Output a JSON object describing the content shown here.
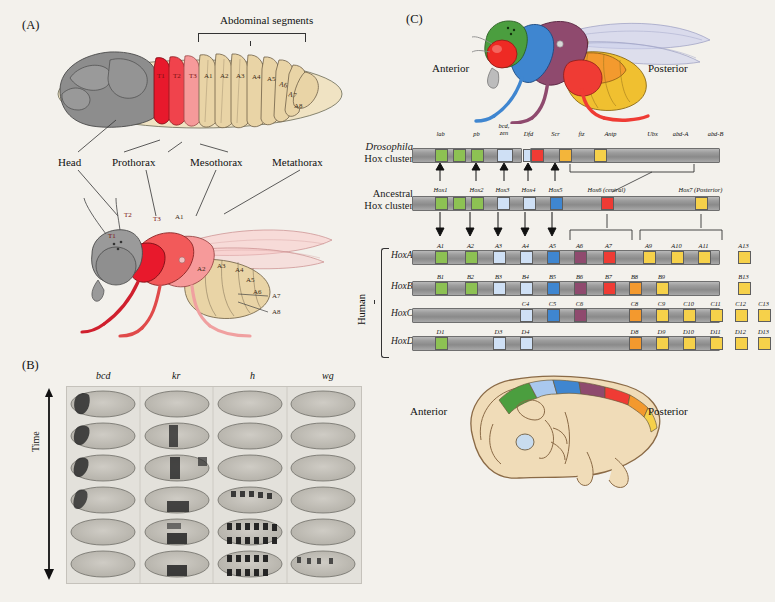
{
  "figure": {
    "panels": [
      {
        "id": "A",
        "letter": "(A)"
      },
      {
        "id": "B",
        "letter": "(B)"
      },
      {
        "id": "C",
        "letter": "(C)"
      }
    ]
  },
  "panelA": {
    "letter": "(A)",
    "abdominal_bracket_label": "Abdominal segments",
    "larva_segments": [
      "T1",
      "T2",
      "T3",
      "A1",
      "A2",
      "A3",
      "A4",
      "A5",
      "A6",
      "A7",
      "A8"
    ],
    "callouts": [
      "Head",
      "Prothorax",
      "Mesothorax",
      "Metathorax"
    ],
    "adult_segments": [
      "T1",
      "T2",
      "T3",
      "A1",
      "A2",
      "A3",
      "A4",
      "A5",
      "A6",
      "A7",
      "A8"
    ],
    "colors": {
      "head": "#8d8d8d",
      "t1": "#e8192c",
      "t2": "#f04a52",
      "t3": "#f49a9a",
      "abdomen": "#e8d3a5"
    }
  },
  "panelB": {
    "letter": "(B)",
    "column_headers": [
      "bcd",
      "kr",
      "h",
      "wg"
    ],
    "time_axis_label": "Time",
    "rows": 6,
    "columns": 4
  },
  "panelC": {
    "letter": "(C)",
    "fly_anterior_label": "Anterior",
    "fly_posterior_label": "Posterior",
    "embryo_anterior_label": "Anterior",
    "embryo_posterior_label": "Posterior",
    "human_bracket_label": "Human",
    "row_labels": {
      "drosophila": [
        "Drosophila",
        "Hox cluster"
      ],
      "ancestral": [
        "Ancestral",
        "Hox cluster"
      ],
      "hoxa": "HoxA",
      "hoxb": "HoxB",
      "hoxc": "HoxC",
      "hoxd": "HoxD"
    },
    "drosophila_genes": [
      {
        "label": "lab",
        "x": 22,
        "w": 13,
        "color": "#8dc153"
      },
      {
        "label": "",
        "x": 40,
        "w": 13,
        "color": "#8dc153"
      },
      {
        "label": "pb",
        "x": 58,
        "w": 13,
        "color": "#8dc153"
      },
      {
        "label": "bcd, zen",
        "x": 84,
        "w": 16,
        "color": "#cfe0f5"
      },
      {
        "label": "Dfd",
        "x": 110,
        "w": 13,
        "color": "#cfe0f5"
      },
      {
        "label": "Scr",
        "x": 137,
        "w": 13,
        "color": "#3f86d0"
      },
      {
        "label": "ftz",
        "x": 163,
        "w": 13,
        "color": "#8f4a6e"
      },
      {
        "label": "Antp",
        "x": 192,
        "w": 13,
        "color": "#8f4a6e"
      },
      {
        "label": "Ubx",
        "x": 234,
        "w": 13,
        "color": "#ef3b34"
      },
      {
        "label": "abd-A",
        "x": 262,
        "w": 13,
        "color": "#f3b53a"
      },
      {
        "label": "abd-B",
        "x": 297,
        "w": 13,
        "color": "#f6d14a"
      }
    ],
    "ancestral_genes": [
      {
        "label": "Hox1",
        "x": 22,
        "w": 13,
        "color": "#8dc153"
      },
      {
        "label": "",
        "x": 40,
        "w": 13,
        "color": "#8dc153"
      },
      {
        "label": "Hox2",
        "x": 58,
        "w": 13,
        "color": "#8dc153"
      },
      {
        "label": "Hox3",
        "x": 84,
        "w": 13,
        "color": "#cfe0f5"
      },
      {
        "label": "Hox4",
        "x": 110,
        "w": 13,
        "color": "#cfe0f5"
      },
      {
        "label": "Hox5",
        "x": 137,
        "w": 13,
        "color": "#3f86d0"
      },
      {
        "label": "Hox6 (central)",
        "x": 188,
        "w": 13,
        "color": "#ef3b34"
      },
      {
        "label": "Hox7 (Posterior)",
        "x": 282,
        "w": 13,
        "color": "#f6d14a"
      }
    ],
    "hoxa_genes": [
      {
        "label": "A1",
        "x": 22,
        "w": 13,
        "color": "#8dc153"
      },
      {
        "label": "A2",
        "x": 52,
        "w": 13,
        "color": "#8dc153"
      },
      {
        "label": "A3",
        "x": 80,
        "w": 13,
        "color": "#cfe0f5"
      },
      {
        "label": "A4",
        "x": 107,
        "w": 13,
        "color": "#cfe0f5"
      },
      {
        "label": "A5",
        "x": 134,
        "w": 13,
        "color": "#3f86d0"
      },
      {
        "label": "A6",
        "x": 161,
        "w": 13,
        "color": "#8f4a6e"
      },
      {
        "label": "A7",
        "x": 190,
        "w": 13,
        "color": "#ef3b34"
      },
      {
        "label": "A9",
        "x": 230,
        "w": 13,
        "color": "#f6d14a"
      },
      {
        "label": "A10",
        "x": 258,
        "w": 13,
        "color": "#f6d14a"
      },
      {
        "label": "A11",
        "x": 285,
        "w": 13,
        "color": "#f6d14a"
      },
      {
        "label": "A13",
        "x": 325,
        "w": 13,
        "color": "#f6d14a"
      }
    ],
    "hoxb_genes": [
      {
        "label": "B1",
        "x": 22,
        "w": 13,
        "color": "#8dc153"
      },
      {
        "label": "B2",
        "x": 52,
        "w": 13,
        "color": "#8dc153"
      },
      {
        "label": "B3",
        "x": 80,
        "w": 13,
        "color": "#cfe0f5"
      },
      {
        "label": "B4",
        "x": 107,
        "w": 13,
        "color": "#cfe0f5"
      },
      {
        "label": "B5",
        "x": 134,
        "w": 13,
        "color": "#3f86d0"
      },
      {
        "label": "B6",
        "x": 161,
        "w": 13,
        "color": "#8f4a6e"
      },
      {
        "label": "B7",
        "x": 190,
        "w": 13,
        "color": "#ef3b34"
      },
      {
        "label": "B8",
        "x": 216,
        "w": 13,
        "color": "#f3992e"
      },
      {
        "label": "B9",
        "x": 243,
        "w": 13,
        "color": "#f6d14a"
      },
      {
        "label": "B13",
        "x": 325,
        "w": 13,
        "color": "#f6d14a"
      }
    ],
    "hoxc_genes": [
      {
        "label": "C4",
        "x": 107,
        "w": 13,
        "color": "#cfe0f5"
      },
      {
        "label": "C5",
        "x": 134,
        "w": 13,
        "color": "#3f86d0"
      },
      {
        "label": "C6",
        "x": 161,
        "w": 13,
        "color": "#8f4a6e"
      },
      {
        "label": "C8",
        "x": 216,
        "w": 13,
        "color": "#f3992e"
      },
      {
        "label": "C9",
        "x": 243,
        "w": 13,
        "color": "#f6d14a"
      },
      {
        "label": "C10",
        "x": 270,
        "w": 13,
        "color": "#f6d14a"
      },
      {
        "label": "C11",
        "x": 297,
        "w": 13,
        "color": "#f6d14a"
      },
      {
        "label": "C12",
        "x": 322,
        "w": 13,
        "color": "#f6d14a"
      },
      {
        "label": "C13",
        "x": 345,
        "w": 13,
        "color": "#f6d14a"
      }
    ],
    "hoxd_genes": [
      {
        "label": "D1",
        "x": 22,
        "w": 13,
        "color": "#8dc153"
      },
      {
        "label": "D3",
        "x": 80,
        "w": 13,
        "color": "#cfe0f5"
      },
      {
        "label": "D4",
        "x": 107,
        "w": 13,
        "color": "#cfe0f5"
      },
      {
        "label": "D8",
        "x": 216,
        "w": 13,
        "color": "#f3992e"
      },
      {
        "label": "D9",
        "x": 243,
        "w": 13,
        "color": "#f6d14a"
      },
      {
        "label": "D10",
        "x": 270,
        "w": 13,
        "color": "#f6d14a"
      },
      {
        "label": "D11",
        "x": 297,
        "w": 13,
        "color": "#f6d14a"
      },
      {
        "label": "D12",
        "x": 322,
        "w": 13,
        "color": "#f6d14a"
      },
      {
        "label": "D13",
        "x": 345,
        "w": 13,
        "color": "#f6d14a"
      }
    ],
    "palette": {
      "green": "#8dc153",
      "light_blue": "#cfe0f5",
      "blue": "#3f86d0",
      "purple": "#8f4a6e",
      "red": "#ef3b34",
      "orange": "#f3992e",
      "yellow": "#f6d14a",
      "chromosome_gray": "#9d9d9d"
    }
  }
}
